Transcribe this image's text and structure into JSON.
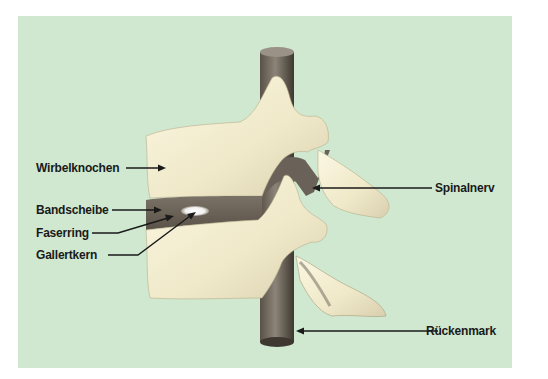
{
  "diagram": {
    "background_color": "#cfe8cf",
    "bone_color": "#f2ecd0",
    "tissue_color": "#6e665a",
    "labels": [
      {
        "id": "wirbelknochen",
        "text": "Wirbelknochen",
        "side": "left"
      },
      {
        "id": "bandscheibe",
        "text": "Bandscheibe",
        "side": "left"
      },
      {
        "id": "faserring",
        "text": "Faserring",
        "side": "left"
      },
      {
        "id": "gallertkern",
        "text": "Gallertkern",
        "side": "left"
      },
      {
        "id": "spinalnerv",
        "text": "Spinalnerv",
        "side": "right"
      },
      {
        "id": "rueckenmark",
        "text": "Rückenmark",
        "side": "right"
      }
    ]
  }
}
